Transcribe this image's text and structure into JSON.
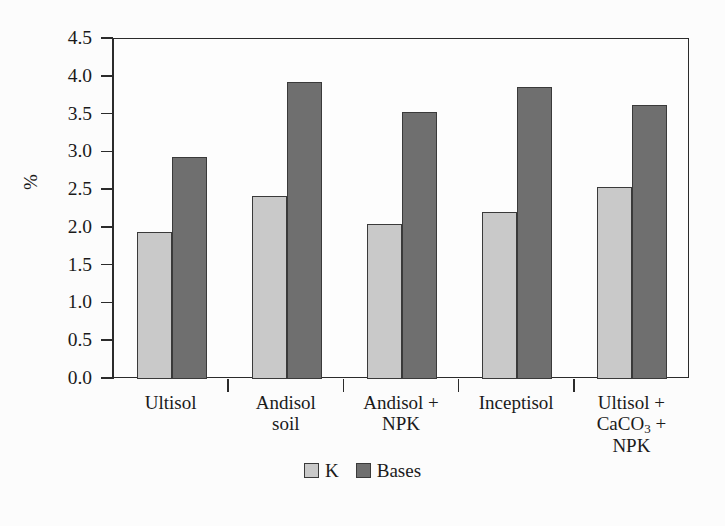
{
  "chart_data": {
    "type": "bar",
    "title": "",
    "subtitle": "",
    "xlabel": "",
    "ylabel": "%",
    "ylim": [
      0.0,
      4.5
    ],
    "grid": false,
    "legend_position": "bottom-center",
    "categories": [
      "Ultisol",
      "Andisol soil",
      "Andisol + NPK",
      "Inceptisol",
      "Ultisol + CaCO3 + NPK"
    ],
    "category_lines": [
      [
        "Ultisol"
      ],
      [
        "Andisol",
        "soil"
      ],
      [
        "Andisol +",
        "NPK"
      ],
      [
        "Inceptisol"
      ],
      [
        "Ultisol +",
        "CaCO_3 +",
        "NPK"
      ]
    ],
    "series": [
      {
        "name": "K",
        "color": "#c9c9c9",
        "values": [
          1.95,
          2.42,
          2.05,
          2.21,
          2.54
        ]
      },
      {
        "name": "Bases",
        "color": "#6f6f6f",
        "values": [
          2.94,
          3.93,
          3.53,
          3.86,
          3.63
        ]
      }
    ],
    "ytick_labels": [
      "0.0",
      "0.5",
      "1.0",
      "1.5",
      "2.0",
      "2.5",
      "3.0",
      "3.5",
      "4.0",
      "4.5"
    ],
    "ytick_values": [
      0.0,
      0.5,
      1.0,
      1.5,
      2.0,
      2.5,
      3.0,
      3.5,
      4.0,
      4.5
    ]
  },
  "axes": {
    "y_title": "%"
  },
  "legend": {
    "items": [
      {
        "label": "K",
        "swatch": "light-gray-swatch"
      },
      {
        "label": "Bases",
        "swatch": "dark-gray-swatch"
      }
    ]
  },
  "ghost_text": {
    "line1": "",
    "line2": "",
    "line3": "",
    "line4": ""
  }
}
